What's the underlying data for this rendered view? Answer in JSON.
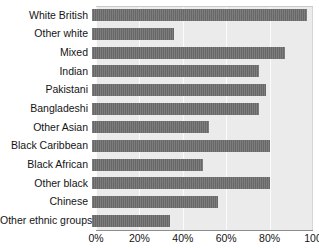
{
  "chart_data": {
    "type": "bar",
    "orientation": "horizontal",
    "title": "",
    "subtitle": "",
    "xlabel": "",
    "ylabel": "",
    "xlim": [
      0,
      100
    ],
    "grid": true,
    "legend": null,
    "bar_color": "#6d6d6d",
    "plot_background": "#ebebeb",
    "gridline_color": "#fbfbfb",
    "tick_labels": [
      "0%",
      "20%",
      "40%",
      "60%",
      "80%",
      "100"
    ],
    "tick_values": [
      0,
      20,
      40,
      60,
      80,
      100
    ],
    "categories": [
      "White British",
      "Other white",
      "Mixed",
      "Indian",
      "Pakistani",
      "Bangladeshi",
      "Other Asian",
      "Black Caribbean",
      "Black African",
      "Other black",
      "Chinese",
      "Other ethnic groups"
    ],
    "values": [
      99,
      38,
      89,
      77,
      80,
      77,
      54,
      82,
      51,
      82,
      58,
      36
    ]
  }
}
